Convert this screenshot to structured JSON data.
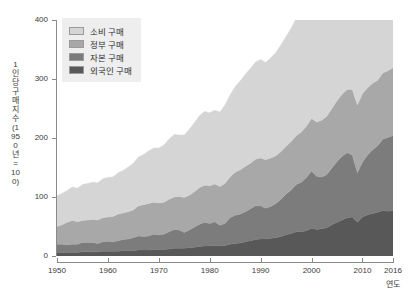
{
  "chart_data": {
    "type": "area",
    "title": "",
    "subtitle": "",
    "xlabel": "연도",
    "ylabel": "1인당 구매 지수(1950년 = 100)",
    "stacked": true,
    "grid": false,
    "legend_position": "top-left",
    "xlim": [
      1950,
      2016
    ],
    "ylim": [
      0,
      400
    ],
    "ytick_labels": [
      "0",
      "100",
      "200",
      "300",
      "400"
    ],
    "ytick_values": [
      0,
      100,
      200,
      300,
      400
    ],
    "xtick_labels": [
      "1950",
      "1960",
      "1970",
      "1980",
      "1990",
      "2000",
      "2010",
      "2016"
    ],
    "xtick_values": [
      1950,
      1960,
      1970,
      1980,
      1990,
      2000,
      2010,
      2016
    ],
    "x": [
      1950,
      1951,
      1952,
      1953,
      1954,
      1955,
      1956,
      1957,
      1958,
      1959,
      1960,
      1961,
      1962,
      1963,
      1964,
      1965,
      1966,
      1967,
      1968,
      1969,
      1970,
      1971,
      1972,
      1973,
      1974,
      1975,
      1976,
      1977,
      1978,
      1979,
      1980,
      1981,
      1982,
      1983,
      1984,
      1985,
      1986,
      1987,
      1988,
      1989,
      1990,
      1991,
      1992,
      1993,
      1994,
      1995,
      1996,
      1997,
      1998,
      1999,
      2000,
      2001,
      2002,
      2003,
      2004,
      2005,
      2006,
      2007,
      2008,
      2009,
      2010,
      2011,
      2012,
      2013,
      2014,
      2015,
      2016
    ],
    "series": [
      {
        "name": "외국인 구매",
        "color": "#585858",
        "values": [
          6,
          6,
          6,
          6,
          6,
          7,
          7,
          7,
          7,
          8,
          8,
          8,
          8,
          9,
          9,
          9,
          10,
          10,
          10,
          11,
          11,
          11,
          12,
          13,
          13,
          13,
          14,
          15,
          16,
          17,
          17,
          18,
          17,
          18,
          20,
          21,
          22,
          24,
          26,
          28,
          29,
          29,
          30,
          31,
          33,
          36,
          38,
          41,
          41,
          43,
          47,
          45,
          46,
          48,
          53,
          57,
          61,
          65,
          66,
          57,
          66,
          70,
          72,
          74,
          77,
          76,
          77
        ]
      },
      {
        "name": "자본 구매",
        "color": "#7c7c7c",
        "values": [
          14,
          14,
          13,
          14,
          14,
          16,
          16,
          16,
          14,
          16,
          17,
          16,
          18,
          19,
          20,
          22,
          24,
          23,
          24,
          26,
          25,
          26,
          29,
          32,
          31,
          27,
          30,
          34,
          38,
          40,
          38,
          40,
          35,
          37,
          45,
          48,
          49,
          51,
          54,
          57,
          56,
          52,
          54,
          58,
          63,
          69,
          74,
          80,
          84,
          90,
          97,
          90,
          88,
          90,
          96,
          103,
          108,
          110,
          105,
          84,
          93,
          101,
          108,
          113,
          121,
          125,
          127
        ]
      },
      {
        "name": "정부 구매",
        "color": "#a8a8a8",
        "values": [
          30,
          33,
          38,
          40,
          38,
          37,
          38,
          39,
          40,
          41,
          41,
          43,
          45,
          45,
          46,
          47,
          51,
          54,
          55,
          54,
          54,
          54,
          55,
          55,
          57,
          59,
          59,
          60,
          62,
          63,
          64,
          64,
          66,
          68,
          69,
          73,
          75,
          77,
          77,
          79,
          81,
          82,
          82,
          81,
          81,
          81,
          82,
          83,
          85,
          87,
          89,
          92,
          96,
          99,
          101,
          103,
          105,
          107,
          111,
          115,
          116,
          114,
          113,
          111,
          112,
          113,
          115
        ]
      },
      {
        "name": "소비 구매",
        "color": "#d5d5d5",
        "values": [
          52,
          53,
          54,
          57,
          57,
          61,
          62,
          63,
          63,
          66,
          67,
          67,
          70,
          72,
          76,
          79,
          83,
          85,
          89,
          92,
          93,
          97,
          102,
          106,
          104,
          106,
          112,
          117,
          122,
          125,
          124,
          125,
          126,
          133,
          139,
          145,
          151,
          156,
          161,
          165,
          167,
          165,
          170,
          175,
          181,
          186,
          192,
          199,
          207,
          216,
          223,
          225,
          230,
          236,
          243,
          250,
          256,
          259,
          254,
          245,
          250,
          252,
          256,
          261,
          268,
          275,
          281
        ]
      }
    ]
  },
  "legend": {
    "items": [
      {
        "label": "소비 구매",
        "color": "#d5d5d5"
      },
      {
        "label": "정부 구매",
        "color": "#a8a8a8"
      },
      {
        "label": "자본 구매",
        "color": "#7c7c7c"
      },
      {
        "label": "외국인 구매",
        "color": "#585858"
      }
    ]
  },
  "axes": {
    "y_title": "1인당 구매 지수(1950년 = 100)",
    "x_title": "연도"
  }
}
